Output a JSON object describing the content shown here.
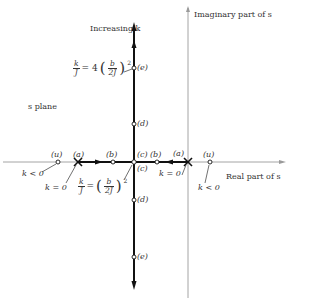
{
  "diagram": {
    "plane_label": "s plane",
    "axes": {
      "real_label": "Real part of s",
      "imaginary_label": "Imaginary part of s"
    },
    "direction_label": "Increasing k",
    "point_labels": {
      "u": "(u)",
      "a": "(a)",
      "b": "(b)",
      "c": "(c)",
      "d": "(d)",
      "e": "(e)"
    },
    "annotations": {
      "k_negative": "k < 0",
      "k_zero": "k = 0",
      "breakaway_eq": {
        "lhs_num": "k",
        "lhs_den": "J",
        "equals": "=",
        "rhs_num": "b",
        "rhs_den": "2J",
        "exponent": "2"
      },
      "upper_eq": {
        "lhs_num": "k",
        "lhs_den": "J",
        "equals": "= 4",
        "rhs_num": "b",
        "rhs_den": "2J",
        "exponent": "2"
      }
    },
    "colors": {
      "locus": "#111111",
      "axis": "#999999",
      "text": "#333333"
    }
  }
}
